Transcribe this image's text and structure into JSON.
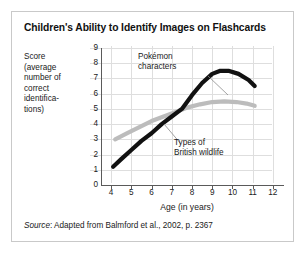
{
  "figure": {
    "title": "Children's Ability to Identify Images on Flashcards",
    "y_axis_caption": "Score (average number of correct identifications)",
    "y_axis_caption_lines": [
      "Score",
      "(average",
      "number of",
      "correct",
      "identifica-",
      "tions)"
    ],
    "x_axis_title": "Age (in years)",
    "source_label": "Source",
    "source_text": ": Adapted from Balmford et al., 2002, p. 2367"
  },
  "chart_data": {
    "type": "line",
    "title": "Children's Ability to Identify Images on Flashcards",
    "xlabel": "Age (in years)",
    "ylabel": "Score (average number of correct identifications)",
    "xlim": [
      3.5,
      12.5
    ],
    "ylim": [
      0,
      9
    ],
    "xticks": [
      4,
      5,
      6,
      7,
      8,
      9,
      10,
      11,
      12
    ],
    "yticks": [
      0,
      1,
      2,
      3,
      4,
      5,
      6,
      7,
      8,
      9
    ],
    "grid": true,
    "legend": "annotations",
    "series": [
      {
        "name": "Pokémon characters",
        "color": "#111111",
        "annotation": "Pokémon characters",
        "annotation_lines": [
          "Pokémon",
          "characters"
        ],
        "x": [
          4.1,
          4.5,
          5.0,
          5.5,
          6.0,
          6.5,
          7.0,
          7.5,
          8.0,
          8.5,
          9.0,
          9.4,
          9.8,
          10.3,
          10.8,
          11.1
        ],
        "y": [
          1.2,
          1.7,
          2.3,
          2.9,
          3.4,
          4.0,
          4.5,
          5.0,
          5.9,
          6.7,
          7.3,
          7.5,
          7.5,
          7.3,
          6.9,
          6.5
        ]
      },
      {
        "name": "Types of British wildlife",
        "color": "#bcbcbc",
        "annotation": "Types of British wildlife",
        "annotation_lines": [
          "Types of",
          "British wildlife"
        ],
        "x": [
          4.2,
          4.8,
          5.4,
          6.0,
          6.6,
          7.2,
          7.8,
          8.4,
          9.0,
          9.6,
          10.2,
          10.7,
          11.1
        ],
        "y": [
          3.0,
          3.4,
          3.8,
          4.2,
          4.5,
          4.8,
          5.1,
          5.3,
          5.45,
          5.5,
          5.45,
          5.35,
          5.2
        ]
      }
    ],
    "crossover": {
      "x": 7.6,
      "y": 4.9
    }
  }
}
